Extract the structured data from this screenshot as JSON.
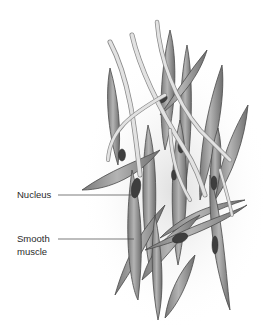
{
  "diagram": {
    "labels": [
      {
        "id": "nucleus",
        "text": "Nucleus"
      },
      {
        "id": "smooth-muscle",
        "line1": "Smooth",
        "line2": "muscle"
      }
    ],
    "colors": {
      "cell_fill": "#9a9a9a",
      "cell_edge": "#4a4a4a",
      "nucleus_fill": "#3e3e3e",
      "fiber_fill": "#dcdcdc",
      "background": "#ffffff"
    }
  }
}
